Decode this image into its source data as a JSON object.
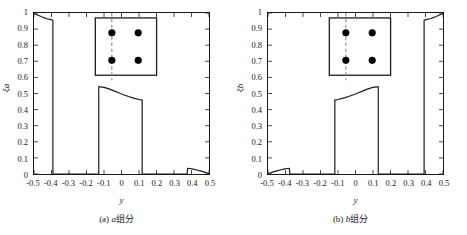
{
  "figure": {
    "xlabel": "y",
    "xticks": [
      "-0.5",
      "-0.4",
      "-0.3",
      "-0.2",
      "-0.1",
      "0",
      "0.1",
      "0.2",
      "0.3",
      "0.4",
      "0.5"
    ],
    "xtick_values": [
      -0.5,
      -0.4,
      -0.3,
      -0.2,
      -0.1,
      0,
      0.1,
      0.2,
      0.3,
      0.4,
      0.5
    ],
    "yticks": [
      "0",
      "0.1",
      "0.2",
      "0.3",
      "0.4",
      "0.5",
      "0.6",
      "0.7",
      "0.8",
      "0.9",
      "1"
    ],
    "ytick_values": [
      0,
      0.1,
      0.2,
      0.3,
      0.4,
      0.5,
      0.6,
      0.7,
      0.8,
      0.9,
      1
    ],
    "line_color": "#1a1a1a",
    "inset_dot_color": "#000000",
    "inset_dash_color": "#8c8c8c"
  },
  "panels": [
    {
      "id": "a",
      "caption_prefix": "(a) ",
      "caption_symbol": "a",
      "caption_suffix": "组分",
      "ylabel": "ξa",
      "chart_data": {
        "type": "line",
        "title": "(a) a组分",
        "xlabel": "y",
        "ylabel": "ξa",
        "xlim": [
          -0.5,
          0.5
        ],
        "ylim": [
          0,
          1
        ],
        "grid": false,
        "legend": "none",
        "series": [
          {
            "name": "xi_a",
            "points": [
              [
                -0.5,
                1.0
              ],
              [
                -0.49,
                0.993
              ],
              [
                -0.48,
                0.988
              ],
              [
                -0.47,
                0.983
              ],
              [
                -0.46,
                0.978
              ],
              [
                -0.45,
                0.974
              ],
              [
                -0.44,
                0.97
              ],
              [
                -0.43,
                0.966
              ],
              [
                -0.42,
                0.963
              ],
              [
                -0.41,
                0.96
              ],
              [
                -0.4,
                0.957
              ],
              [
                -0.392,
                0.955
              ],
              [
                -0.392,
                0.0
              ],
              [
                -0.13,
                0.0
              ],
              [
                -0.13,
                0.541
              ],
              [
                -0.12,
                0.541
              ],
              [
                -0.1,
                0.538
              ],
              [
                -0.08,
                0.532
              ],
              [
                -0.06,
                0.524
              ],
              [
                -0.04,
                0.515
              ],
              [
                -0.02,
                0.506
              ],
              [
                0.0,
                0.497
              ],
              [
                0.02,
                0.489
              ],
              [
                0.04,
                0.481
              ],
              [
                0.06,
                0.474
              ],
              [
                0.08,
                0.468
              ],
              [
                0.1,
                0.463
              ],
              [
                0.118,
                0.459
              ],
              [
                0.118,
                0.0
              ],
              [
                0.375,
                0.0
              ],
              [
                0.378,
                0.035
              ],
              [
                0.39,
                0.034
              ],
              [
                0.41,
                0.03
              ],
              [
                0.43,
                0.025
              ],
              [
                0.45,
                0.019
              ],
              [
                0.47,
                0.013
              ],
              [
                0.49,
                0.006
              ],
              [
                0.5,
                0.0
              ]
            ]
          }
        ],
        "inset": {
          "shape": "square",
          "dots": 4,
          "dashed_line": "vertical",
          "dashed_line_x": -0.1
        }
      }
    },
    {
      "id": "b",
      "caption_prefix": "(b) ",
      "caption_symbol": "b",
      "caption_suffix": "组分",
      "ylabel": "ξb",
      "chart_data": {
        "type": "line",
        "title": "(b) b组分",
        "xlabel": "y",
        "ylabel": "ξb",
        "xlim": [
          -0.5,
          0.5
        ],
        "ylim": [
          0,
          1
        ],
        "grid": false,
        "legend": "none",
        "series": [
          {
            "name": "xi_b",
            "points": [
              [
                -0.5,
                0.0
              ],
              [
                -0.49,
                0.006
              ],
              [
                -0.47,
                0.013
              ],
              [
                -0.45,
                0.019
              ],
              [
                -0.43,
                0.025
              ],
              [
                -0.41,
                0.03
              ],
              [
                -0.39,
                0.034
              ],
              [
                -0.378,
                0.035
              ],
              [
                -0.375,
                0.0
              ],
              [
                -0.118,
                0.0
              ],
              [
                -0.118,
                0.459
              ],
              [
                -0.1,
                0.463
              ],
              [
                -0.08,
                0.468
              ],
              [
                -0.06,
                0.474
              ],
              [
                -0.04,
                0.481
              ],
              [
                -0.02,
                0.489
              ],
              [
                0.0,
                0.497
              ],
              [
                0.02,
                0.506
              ],
              [
                0.04,
                0.515
              ],
              [
                0.06,
                0.524
              ],
              [
                0.08,
                0.532
              ],
              [
                0.1,
                0.538
              ],
              [
                0.12,
                0.541
              ],
              [
                0.13,
                0.541
              ],
              [
                0.13,
                0.0
              ],
              [
                0.392,
                0.0
              ],
              [
                0.392,
                0.955
              ],
              [
                0.4,
                0.957
              ],
              [
                0.41,
                0.96
              ],
              [
                0.42,
                0.963
              ],
              [
                0.43,
                0.966
              ],
              [
                0.44,
                0.97
              ],
              [
                0.45,
                0.974
              ],
              [
                0.46,
                0.978
              ],
              [
                0.47,
                0.983
              ],
              [
                0.48,
                0.988
              ],
              [
                0.49,
                0.993
              ],
              [
                0.5,
                1.0
              ]
            ]
          }
        ],
        "inset": {
          "shape": "square",
          "dots": 4,
          "dashed_line": "vertical",
          "dashed_line_x": -0.1
        }
      }
    }
  ]
}
